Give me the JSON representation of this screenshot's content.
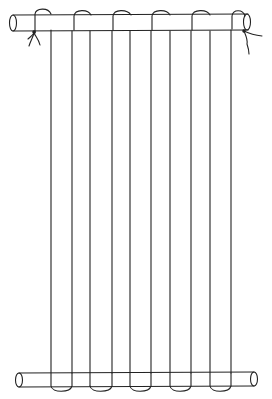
{
  "figure": {
    "description": "Line drawing of warp threads wound between two rods (simple loom)",
    "ink_color": "#222222",
    "background": "#ffffff",
    "top_rod": {
      "x1": 10,
      "x2": 250,
      "y_top": 15,
      "y_bottom": 31
    },
    "bottom_rod": {
      "x1": 15,
      "x2": 256,
      "y_top": 373,
      "y_bottom": 387
    },
    "warp_pairs": [
      {
        "left": 51,
        "right": 72
      },
      {
        "left": 90,
        "right": 112
      },
      {
        "left": 130,
        "right": 151
      },
      {
        "left": 170,
        "right": 191
      },
      {
        "left": 210,
        "right": 231
      }
    ],
    "ties": [
      "left-end-tie",
      "right-end-tie"
    ]
  }
}
